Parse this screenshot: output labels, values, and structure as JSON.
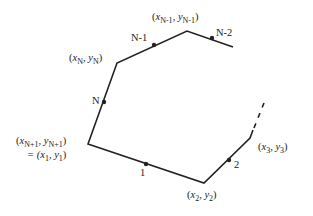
{
  "diagram": {
    "colors": {
      "line": "#222222",
      "text": "#222222",
      "background": "#ffffff"
    },
    "vertices": [
      {
        "id": "v1",
        "x": 88,
        "y": 144,
        "label_line1_var": "x",
        "label_line1_sub": "N+1",
        "label_line1_var2": "y",
        "label_line1_sub2": "N+1",
        "label_line2": "= (x",
        "label_line2_sub": "1",
        "label_line2_var2": ", y",
        "label_line2_sub2": "1"
      },
      {
        "id": "v2",
        "x": 204,
        "y": 183,
        "label_var": "x",
        "label_sub": "2",
        "label_var2": "y",
        "label_sub2": "2"
      },
      {
        "id": "v3",
        "x": 250,
        "y": 138,
        "label_var": "x",
        "label_sub": "3",
        "label_var2": "y",
        "label_sub2": "3"
      },
      {
        "id": "vN",
        "x": 117,
        "y": 63,
        "label_var": "x",
        "label_sub": "N",
        "label_var2": "y",
        "label_sub2": "N"
      },
      {
        "id": "vNm1",
        "x": 187,
        "y": 31,
        "label_var": "x",
        "label_sub": "N-1",
        "label_var2": "y",
        "label_sub2": "N-1"
      }
    ],
    "segments": [
      {
        "label": "1",
        "dot": [
          146,
          164
        ]
      },
      {
        "label": "2",
        "dot": [
          229,
          160
        ]
      },
      {
        "label": "N",
        "dot": [
          104,
          102
        ]
      },
      {
        "label": "N-1",
        "dot": [
          154,
          45
        ]
      },
      {
        "label": "N-2",
        "dot": [
          212,
          38
        ]
      }
    ]
  }
}
